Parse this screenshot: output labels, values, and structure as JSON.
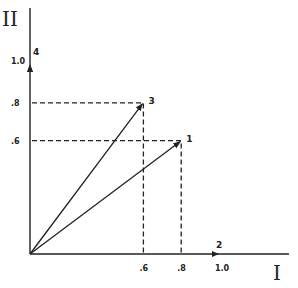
{
  "diagram": {
    "type": "vector-diagram",
    "axes": {
      "x": {
        "label": "I",
        "end_label": "2",
        "ticks": [
          ".6",
          ".8",
          "1.0"
        ],
        "tick_values": [
          0.6,
          0.8,
          1.0
        ]
      },
      "y": {
        "label": "II",
        "end_label": "4",
        "ticks": [
          ".6",
          ".8",
          "1.0"
        ],
        "tick_values": [
          0.6,
          0.8,
          1.0
        ]
      }
    },
    "vectors": [
      {
        "id": "1",
        "label": "1",
        "x": 0.8,
        "y": 0.6
      },
      {
        "id": "3",
        "label": "3",
        "x": 0.6,
        "y": 0.8
      }
    ],
    "unit_vectors": [
      {
        "id": "2",
        "label": "2",
        "x": 1.0,
        "y": 0.0
      },
      {
        "id": "4",
        "label": "4",
        "x": 0.0,
        "y": 1.0
      }
    ],
    "color": "#222222"
  }
}
